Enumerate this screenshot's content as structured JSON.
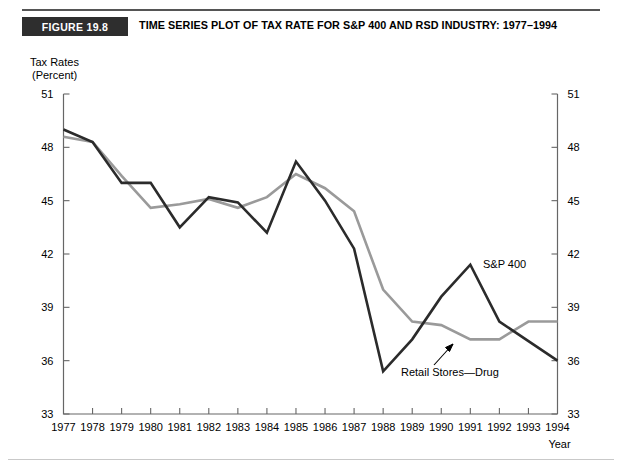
{
  "figure": {
    "badge": "FIGURE 19.8",
    "title": "TIME SERIES PLOT OF TAX RATE FOR S&P 400 AND RSD INDUSTRY: 1977–1994"
  },
  "axes": {
    "y_label_line1": "Tax Rates",
    "y_label_line2": "(Percent)",
    "x_label": "Year",
    "y_ticks": [
      "33",
      "36",
      "39",
      "42",
      "45",
      "48",
      "51"
    ],
    "x_ticks": [
      "1977",
      "1978",
      "1979",
      "1980",
      "1981",
      "1982",
      "1983",
      "1984",
      "1985",
      "1986",
      "1987",
      "1988",
      "1989",
      "1990",
      "1991",
      "1992",
      "1993",
      "1994"
    ]
  },
  "annotations": {
    "sp400_label": "S&P 400",
    "retail_label": "Retail Stores—Drug"
  },
  "colors": {
    "sp400": "#2b2b2b",
    "retail": "#9a9a9a",
    "axis": "#666666",
    "badge_bg": "#2e2e2e"
  },
  "chart_data": {
    "type": "line",
    "title": "TIME SERIES PLOT OF TAX RATE FOR S&P 400 AND RSD INDUSTRY: 1977–1994",
    "xlabel": "Year",
    "ylabel": "Tax Rates (Percent)",
    "xlim": [
      1977,
      1994
    ],
    "ylim": [
      33,
      51
    ],
    "ytick_step": 3,
    "grid": false,
    "legend": "inline-annotations",
    "x": [
      1977,
      1978,
      1979,
      1980,
      1981,
      1982,
      1983,
      1984,
      1985,
      1986,
      1987,
      1988,
      1989,
      1990,
      1991,
      1992,
      1993,
      1994
    ],
    "series": [
      {
        "name": "S&P 400",
        "color": "#2b2b2b",
        "values": [
          49.0,
          48.3,
          46.0,
          46.0,
          43.5,
          45.2,
          44.9,
          43.2,
          47.2,
          45.0,
          42.3,
          35.4,
          37.2,
          39.6,
          41.4,
          38.2,
          37.1,
          36.0
        ]
      },
      {
        "name": "Retail Stores—Drug",
        "color": "#9a9a9a",
        "values": [
          48.6,
          48.3,
          46.4,
          44.6,
          44.8,
          45.1,
          44.6,
          45.2,
          46.5,
          45.7,
          44.4,
          40.0,
          38.2,
          38.0,
          37.2,
          37.2,
          38.2,
          38.2
        ]
      }
    ]
  }
}
